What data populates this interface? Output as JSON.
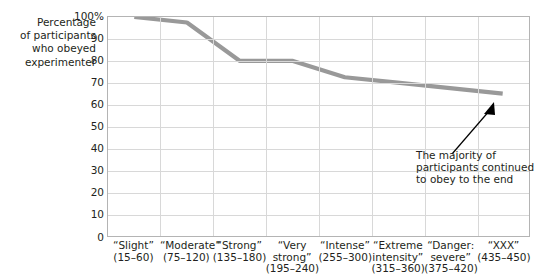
{
  "chart_data": {
    "type": "line",
    "title": "",
    "subtitle": "",
    "ylabel": "Percentage of participants who obeyed experimenter",
    "ylabel_lines": [
      "Percentage",
      "of participants",
      "who obeyed",
      "experimenter"
    ],
    "xlabel": "",
    "ylim": [
      0,
      100
    ],
    "ytick_labels": [
      "100%",
      "90",
      "80",
      "70",
      "60",
      "50",
      "40",
      "30",
      "20",
      "10",
      "0"
    ],
    "ytick_values": [
      100,
      90,
      80,
      70,
      60,
      50,
      40,
      30,
      20,
      10,
      0
    ],
    "grid": true,
    "legend_position": "none",
    "categories": [
      "“Slight” (15–60)",
      "“Moderate” (75–120)",
      "“Strong” (135–180)",
      "“Very strong” (195–240)",
      "“Intense” (255–300)",
      "“Extreme intensity” (315–360)",
      "“Danger: severe” (375–420)",
      "“XXX” (435–450)"
    ],
    "category_lines": [
      [
        "“Slight”",
        "(15–60)",
        ""
      ],
      [
        "“Moderate”",
        "(75–120)",
        ""
      ],
      [
        "“Strong”",
        "(135–180)",
        ""
      ],
      [
        "“Very",
        "strong”",
        "(195–240)"
      ],
      [
        "“Intense”",
        "(255–300)",
        ""
      ],
      [
        "“Extreme",
        "intensity”",
        "(315–360)"
      ],
      [
        "“Danger:",
        "severe”",
        "(375–420)"
      ],
      [
        "“XXX”",
        "(435–450)",
        ""
      ]
    ],
    "values": [
      100,
      97.5,
      80,
      80,
      72.5,
      70,
      67.5,
      65
    ],
    "series": [
      {
        "name": "Percentage who obeyed",
        "color": "#999999",
        "values": [
          100,
          97.5,
          80,
          80,
          72.5,
          70,
          67.5,
          65
        ]
      }
    ],
    "annotations": [
      {
        "text": "The majority of participants continued to obey to the end",
        "lines": [
          "The majority of",
          "participants continued",
          "to obey to the end"
        ],
        "points_to_category": "“XXX” (435–450)"
      }
    ]
  },
  "colors": {
    "line": "#999999",
    "grid": "#d8d8d8",
    "axis": "#b4b4b4",
    "text": "#231f20",
    "arrow": "#000000",
    "background": "#ffffff"
  }
}
